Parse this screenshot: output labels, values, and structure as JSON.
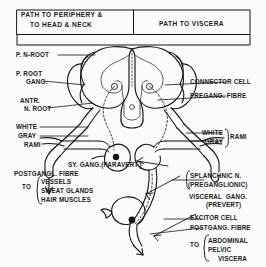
{
  "figure": {
    "type": "anatomical-diagram"
  },
  "header": {
    "left_cell": "PATH TO PERIPHERY &\n TO HEAD & NECK",
    "left_line1": "PATH TO PERIPHERY &",
    "left_line2": "TO HEAD & NECK",
    "right_cell": "PATH TO VISCERA"
  },
  "labels_left": [
    {
      "id": "post-n-root",
      "text": "P. N-ROOT"
    },
    {
      "id": "p-root-gang-1",
      "text": "P. ROOT"
    },
    {
      "id": "p-root-gang-2",
      "text": "GANG."
    },
    {
      "id": "antr-1",
      "text": "ANTR."
    },
    {
      "id": "antr-2",
      "text": "N. ROOT"
    },
    {
      "id": "rami-white",
      "text": "WHITE"
    },
    {
      "id": "rami-gray",
      "text": "GRAY"
    },
    {
      "id": "rami-rami",
      "text": "RAMI"
    },
    {
      "id": "postgangl-fibre",
      "text": "POSTGANGL. FIBRE"
    },
    {
      "id": "to-left",
      "text": "TO"
    },
    {
      "id": "target-1",
      "text": "VESSELS"
    },
    {
      "id": "target-2",
      "text": "SWEAT GLANDS"
    },
    {
      "id": "target-3",
      "text": "HAIR MUSCLES"
    }
  ],
  "labels_right": [
    {
      "id": "connector-cell",
      "text": "CONNECTOR CELL"
    },
    {
      "id": "pregang-fibre",
      "text": "PREGANG. FIBRE"
    },
    {
      "id": "r-white",
      "text": "WHITE"
    },
    {
      "id": "r-gray",
      "text": "GRAY"
    },
    {
      "id": "r-rami",
      "text": "RAMI"
    },
    {
      "id": "splanchnic-1",
      "text": "SPLANCHNIC N."
    },
    {
      "id": "splanchnic-2",
      "text": "(PREGANGLIONIC)"
    },
    {
      "id": "visceral-gang-1",
      "text": "VISCERAL  GANG."
    },
    {
      "id": "visceral-gang-2",
      "text": "(PREVERT)"
    },
    {
      "id": "excitor-cell",
      "text": "EXCITOR CELL"
    },
    {
      "id": "postgang-fibre-r",
      "text": "POSTGANG. FIBRE"
    },
    {
      "id": "to-right",
      "text": "TO"
    },
    {
      "id": "abd-1",
      "text": "ABDOMINAL"
    },
    {
      "id": "abd-2",
      "text": "PELVIC"
    },
    {
      "id": "abd-3",
      "text": "VISCERA"
    }
  ],
  "labels_center": [
    {
      "id": "sy-gang",
      "text": "SY. GANG.(PARAVERT.)"
    }
  ],
  "colors": {
    "ink": "#1a1a1a",
    "background": "#fbfbfb",
    "stroke": "#111111"
  }
}
